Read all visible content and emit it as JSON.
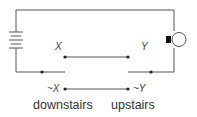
{
  "diagram": {
    "type": "two-way light switch circuit",
    "colors": {
      "wire": "#555555",
      "background": "#ffffff",
      "text": "#444444"
    },
    "components": {
      "battery": {
        "icon": "battery-icon"
      },
      "bulb": {
        "icon": "light-bulb-icon"
      }
    },
    "labels": {
      "x": "X",
      "y": "Y",
      "not_x": "~X",
      "not_y": "~Y",
      "downstairs": "downstairs",
      "upstairs": "upstairs"
    }
  }
}
